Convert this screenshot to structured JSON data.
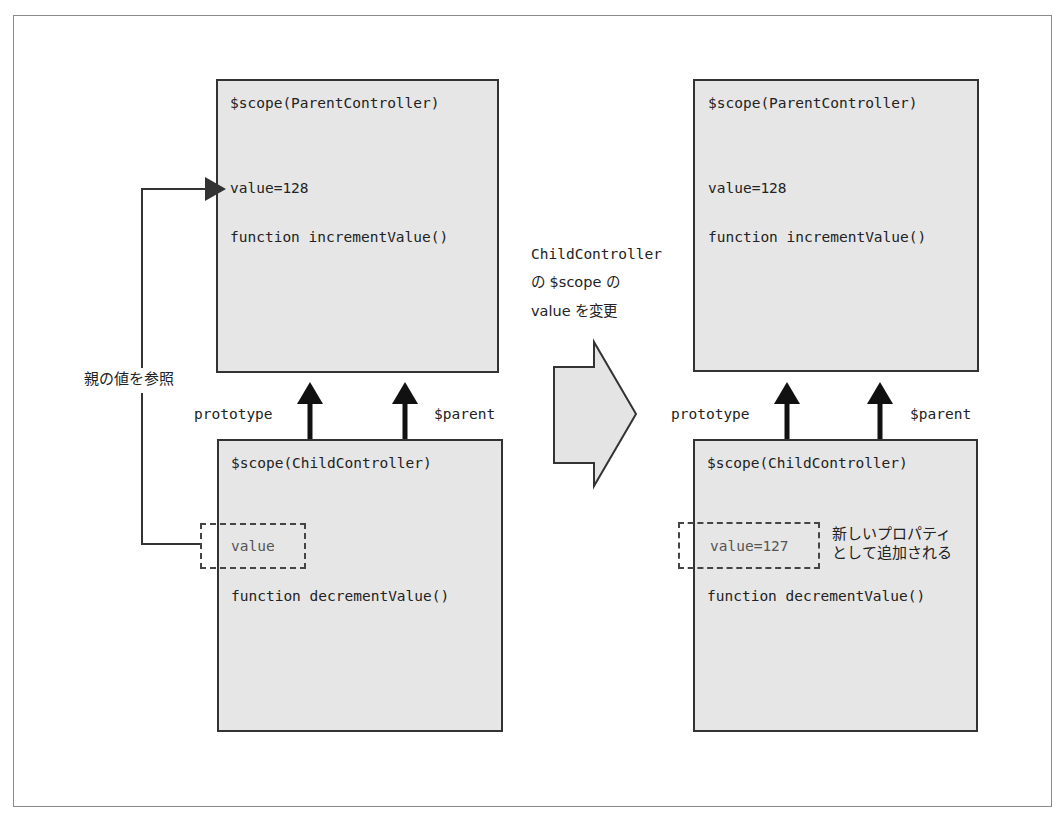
{
  "diagram": {
    "left": {
      "parent_scope": {
        "title": "$scope(ParentController)",
        "value": "value=128",
        "function": "function incrementValue()"
      },
      "child_scope": {
        "title": "$scope(ChildController)",
        "value": "value",
        "function": "function decrementValue()"
      },
      "arrows": {
        "prototype_label": "prototype",
        "parent_label": "$parent"
      },
      "reference_label": "親の値を参照"
    },
    "transition": {
      "line1": "ChildController",
      "line2": "の $scope の",
      "line3": "value を変更"
    },
    "right": {
      "parent_scope": {
        "title": "$scope(ParentController)",
        "value": "value=128",
        "function": "function incrementValue()"
      },
      "child_scope": {
        "title": "$scope(ChildController)",
        "value": "value=127",
        "function": "function decrementValue()"
      },
      "arrows": {
        "prototype_label": "prototype",
        "parent_label": "$parent"
      },
      "new_property_note": {
        "line1": "新しいプロパティ",
        "line2": "として追加される"
      }
    },
    "colors": {
      "box_fill": "#e6e6e6",
      "box_border": "#333333",
      "arrow": "#111111",
      "frame": "#8a8a8a"
    }
  }
}
